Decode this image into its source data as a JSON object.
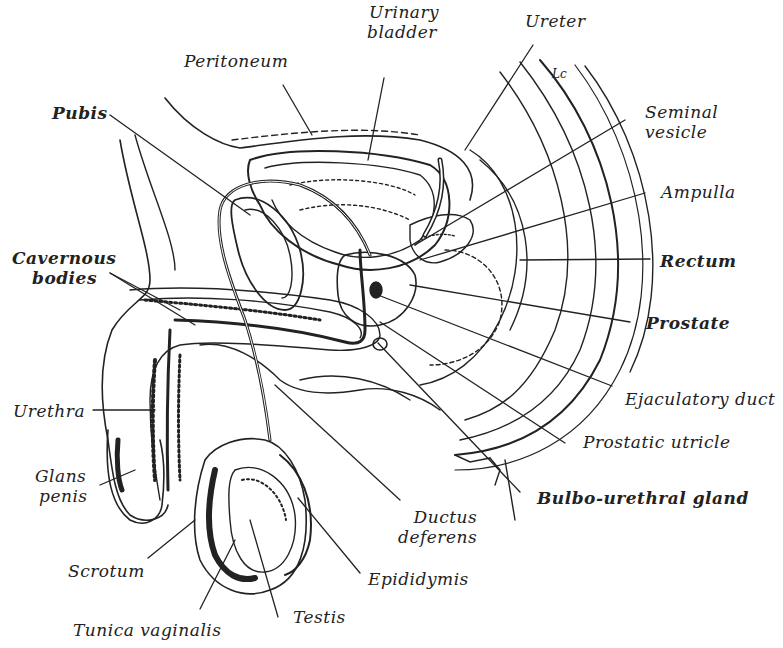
{
  "figure": {
    "signature": "Lc",
    "line_color": "#222222",
    "background": "#ffffff"
  },
  "labels": {
    "peritoneum": "Peritoneum",
    "urinary_bladder_1": "Urinary",
    "urinary_bladder_2": "bladder",
    "ureter": "Ureter",
    "pubis": "Pubis",
    "seminal_vesicle_1": "Seminal",
    "seminal_vesicle_2": "vesicle",
    "ampulla": "Ampulla",
    "cavernous_bodies_1": "Cavernous",
    "cavernous_bodies_2": "bodies",
    "rectum": "Rectum",
    "prostate": "Prostate",
    "urethra": "Urethra",
    "ejaculatory_duct": "Ejaculatory duct",
    "prostatic_utricle": "Prostatic utricle",
    "glans_penis_1": "Glans",
    "glans_penis_2": "penis",
    "bulbo_urethral_gland": "Bulbo-urethral gland",
    "ductus_deferens_1": "Ductus",
    "ductus_deferens_2": "deferens",
    "scrotum": "Scrotum",
    "epididymis": "Epididymis",
    "tunica_vaginalis": "Tunica vaginalis",
    "testis": "Testis"
  }
}
